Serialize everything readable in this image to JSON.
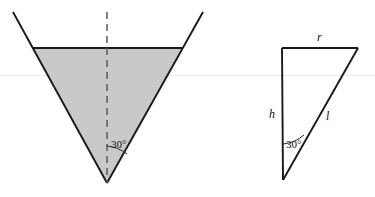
{
  "figure": {
    "background_color": "#ffffff",
    "shade_color": "#c9c9c9",
    "line_color": "#1a1a1a",
    "dash_color": "#5a5a5a",
    "faint_rule_color": "#ececec",
    "left_diagram": {
      "name": "inverted-cone-cross-section",
      "outer_triangle_points": "13,12 203,12 107,183",
      "shaded_trapezoid_points": "33,48 182,48 107,183",
      "top_chord": {
        "x1": 33,
        "y1": 48,
        "x2": 182,
        "y2": 48
      },
      "axis_dashed_line": {
        "x1": 107,
        "y1": 12,
        "x2": 107,
        "y2": 183
      },
      "angle_arc_path": "M 107,148 A 36,36 0 0 1 125,155",
      "angle_label": "30°",
      "angle_label_x": 111,
      "angle_label_y": 148
    },
    "right_diagram": {
      "name": "right-triangle-detail",
      "triangle_points": "282,48 358,48 283,180",
      "vertical_leg": {
        "x1": 282,
        "y1": 48,
        "x2": 283,
        "y2": 180
      },
      "top_leg": {
        "x1": 282,
        "y1": 48,
        "x2": 358,
        "y2": 48
      },
      "hypotenuse": {
        "x1": 358,
        "y1": 48,
        "x2": 283,
        "y2": 180
      },
      "angle_arc_path": "M 283,145 A 36,36 0 0 0 303,136",
      "angle_label": "30°",
      "angle_label_x": 286,
      "angle_label_y": 148,
      "label_r": "r",
      "label_r_x": 317,
      "label_r_y": 41,
      "label_h": "h",
      "label_h_x": 269,
      "label_h_y": 118,
      "label_l": "l",
      "label_l_x": 326,
      "label_l_y": 120
    },
    "faint_rule": {
      "x1": 0,
      "y1": 75.5,
      "x2": 375,
      "y2": 75.5
    }
  }
}
